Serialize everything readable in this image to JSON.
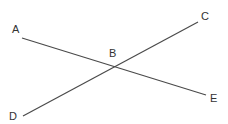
{
  "diagram": {
    "type": "intersecting-lines",
    "line_color": "#4a4a4a",
    "label_color": "#333333",
    "points": {
      "A": {
        "label": "A",
        "x": 22,
        "y": 38,
        "lx": 12,
        "ly": 33
      },
      "C": {
        "label": "C",
        "x": 198,
        "y": 22,
        "lx": 201,
        "ly": 20
      },
      "B": {
        "label": "B",
        "x": 115,
        "y": 67,
        "lx": 109,
        "ly": 57
      },
      "D": {
        "label": "D",
        "x": 23,
        "y": 116,
        "lx": 9,
        "ly": 120
      },
      "E": {
        "label": "E",
        "x": 206,
        "y": 95,
        "lx": 210,
        "ly": 102
      }
    },
    "lines": [
      {
        "name": "AE",
        "from": "A",
        "to": "E"
      },
      {
        "name": "DC",
        "from": "D",
        "to": "C"
      }
    ]
  }
}
